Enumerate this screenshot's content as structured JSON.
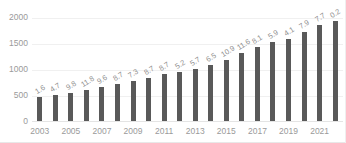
{
  "chart_data": {
    "type": "bar",
    "title": "",
    "subtitle": "",
    "xlabel": "",
    "ylabel": "",
    "grid": true,
    "legend": false,
    "ylim": [
      0,
      2000
    ],
    "yticks": [
      "0",
      "500",
      "1000",
      "1500",
      "2000"
    ],
    "ytick_values": [
      0,
      500,
      1000,
      1500,
      2000
    ],
    "categories": [
      "2003",
      "2004",
      "2005",
      "2006",
      "2007",
      "2008",
      "2009",
      "2010",
      "2011",
      "2012",
      "2013",
      "2014",
      "2015",
      "2016",
      "2017",
      "2018",
      "2019",
      "2020",
      "2021",
      "2022"
    ],
    "xtick_labels": [
      "2003",
      "",
      "2005",
      "",
      "2007",
      "",
      "2009",
      "",
      "2011",
      "",
      "2013",
      "",
      "2015",
      "",
      "2017",
      "",
      "2019",
      "",
      "2021",
      ""
    ],
    "values": [
      470,
      500,
      545,
      590,
      660,
      715,
      760,
      835,
      910,
      950,
      1005,
      1075,
      1180,
      1310,
      1430,
      1510,
      1585,
      1705,
      1855,
      1930
    ],
    "bar_labels": [
      "1.6",
      "4.7",
      "9.8",
      "11.8",
      "9.6",
      "8.7",
      "7.3",
      "8.7",
      "8.7",
      "5.2",
      "5.7",
      "6.5",
      "10.9",
      "11.6",
      "8.1",
      "5.9",
      "4.1",
      "7.9",
      "7.7",
      "0.2"
    ],
    "bar_label_unit": "%",
    "colors": {
      "bar": "#595959",
      "gridline": "#f0f0f0",
      "axis_text": "#9a9a9a",
      "label_text": "#8f8f8f",
      "background": "#ffffff",
      "frame": "#e8e8e8"
    }
  }
}
